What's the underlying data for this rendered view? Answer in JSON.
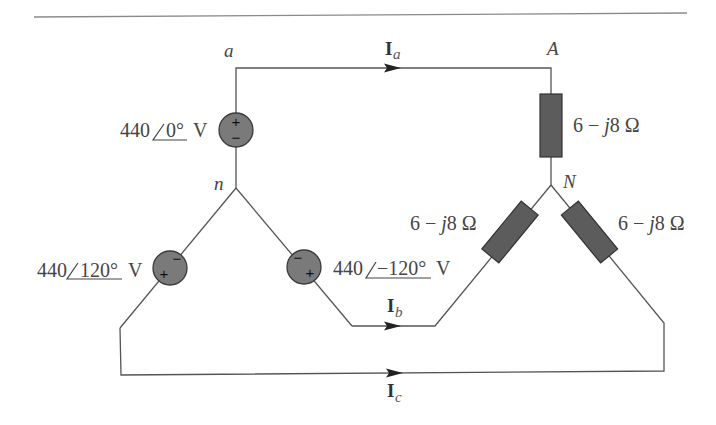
{
  "diagram": {
    "nodes": {
      "a": "a",
      "A": "A",
      "n": "n",
      "N": "N"
    },
    "sources": {
      "a": {
        "magnitude": "440",
        "angle": "0°",
        "unit": "V",
        "plus": "+",
        "minus": "−"
      },
      "b": {
        "magnitude": "440",
        "angle": "−120°",
        "unit": "V",
        "plus": "+",
        "minus": "−"
      },
      "c": {
        "magnitude": "440",
        "angle": "120°",
        "unit": "V",
        "plus": "+",
        "minus": "−"
      }
    },
    "loads": {
      "A": {
        "real": "6",
        "operator": "−",
        "imag_unit": "j",
        "imag": "8",
        "unit": "Ω"
      },
      "B": {
        "real": "6",
        "operator": "−",
        "imag_unit": "j",
        "imag": "8",
        "unit": "Ω"
      },
      "C": {
        "real": "6",
        "operator": "−",
        "imag_unit": "j",
        "imag": "8",
        "unit": "Ω"
      }
    },
    "currents": {
      "a": {
        "symbol": "I",
        "subscript": "a"
      },
      "b": {
        "symbol": "I",
        "subscript": "b"
      },
      "c": {
        "symbol": "I",
        "subscript": "c"
      }
    },
    "colors": {
      "wire": "#555555",
      "source_fill": "#7a7a7a",
      "load_fill": "#5c5c5c",
      "text": "#454545"
    }
  }
}
